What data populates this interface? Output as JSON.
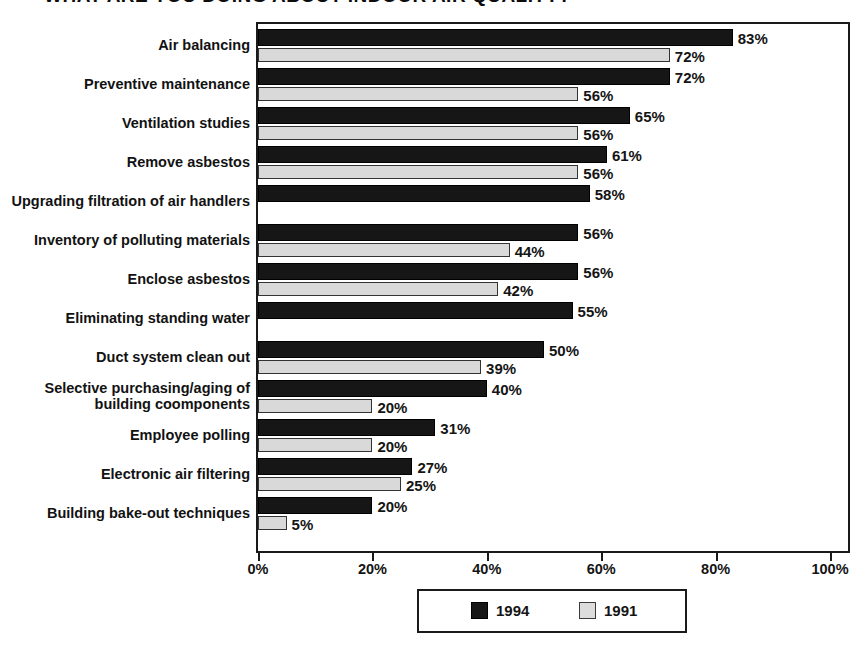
{
  "title": {
    "text": "WHAT ARE YOU DOING ABOUT INDOOR AIR QUALITY?",
    "visible_note": "top of title is cropped off the image"
  },
  "legend": {
    "entries": [
      {
        "label": "1994",
        "color": "#161616",
        "swatch": "filled-black-square"
      },
      {
        "label": "1991",
        "color": "#dcdcdc",
        "swatch": "filled-lightgray-square"
      }
    ]
  },
  "axis": {
    "x_tick_labels": [
      "0%",
      "20%",
      "40%",
      "60%",
      "80%",
      "100%"
    ],
    "x_tick_values": [
      0,
      20,
      40,
      60,
      80,
      100
    ]
  },
  "chart_data": {
    "type": "bar",
    "orientation": "horizontal",
    "title": "WHAT ARE YOU DOING ABOUT INDOOR AIR QUALITY?",
    "xlabel": "",
    "ylabel": "",
    "xlim": [
      0,
      100
    ],
    "grid": false,
    "legend_position": "bottom-center",
    "value_suffix": "%",
    "categories": [
      "Air balancing",
      "Preventive maintenance",
      "Ventilation studies",
      "Remove asbestos",
      "Upgrading filtration of air handlers",
      "Inventory of polluting materials",
      "Enclose asbestos",
      "Eliminating standing water",
      "Duct system clean out",
      "Selective purchasing/aging of\nbuilding coomponents",
      "Employee polling",
      "Electronic air filtering",
      "Building bake-out techniques"
    ],
    "series": [
      {
        "name": "1994",
        "color": "#161616",
        "values": [
          83,
          72,
          65,
          61,
          58,
          56,
          56,
          55,
          50,
          40,
          31,
          27,
          20
        ],
        "labels": [
          "83%",
          "72%",
          "65%",
          "61%",
          "58%",
          "56%",
          "56%",
          "55%",
          "50%",
          "40%",
          "31%",
          "27%",
          "20%"
        ]
      },
      {
        "name": "1991",
        "color": "#d9d9d9",
        "values": [
          72,
          56,
          56,
          56,
          null,
          44,
          42,
          null,
          39,
          20,
          20,
          25,
          5
        ],
        "labels": [
          "72%",
          "56%",
          "56%",
          "56%",
          "",
          "44%",
          "42%",
          "",
          "39%",
          "20%",
          "20%",
          "25%",
          "5%"
        ]
      }
    ]
  }
}
